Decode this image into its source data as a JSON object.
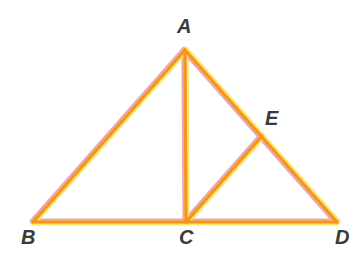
{
  "figure": {
    "background_color": "#ffffff",
    "width": 364,
    "height": 261
  },
  "style": {
    "stroke_core_color": "#F79321",
    "stroke_yellow_fringe": "#FFE24A",
    "stroke_pink_fringe": "#DB8FA8",
    "stroke_width": 3.2,
    "fringe_width": 5.0,
    "label_color": "#3a3a3a"
  },
  "points": {
    "A": {
      "name": "A",
      "x": 185,
      "y": 50
    },
    "B": {
      "name": "B",
      "x": 33,
      "y": 222
    },
    "C": {
      "name": "C",
      "x": 186,
      "y": 222
    },
    "D": {
      "name": "D",
      "x": 337,
      "y": 222
    },
    "E": {
      "name": "E",
      "x": 262,
      "y": 136
    }
  },
  "labels": [
    {
      "text": "A",
      "x": 177,
      "y": 16
    },
    {
      "text": "B",
      "x": 21,
      "y": 227
    },
    {
      "text": "C",
      "x": 179,
      "y": 227
    },
    {
      "text": "D",
      "x": 335,
      "y": 227
    },
    {
      "text": "E",
      "x": 265,
      "y": 108
    }
  ],
  "segments": [
    {
      "name": "segment-AB",
      "from": "A",
      "to": "B"
    },
    {
      "name": "segment-AC",
      "from": "A",
      "to": "C"
    },
    {
      "name": "segment-AD",
      "from": "A",
      "to": "D"
    },
    {
      "name": "segment-BD",
      "from": "B",
      "to": "D"
    },
    {
      "name": "segment-CE",
      "from": "C",
      "to": "E"
    }
  ]
}
